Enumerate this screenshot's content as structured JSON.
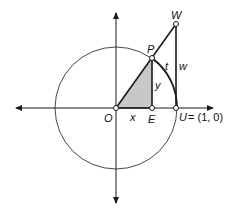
{
  "diagram": {
    "type": "unit-circle",
    "labels": {
      "origin": "O",
      "foot": "E",
      "unit_point": "U",
      "unit_point_coord": "= (1, 0)",
      "circle_point": "P",
      "tangent_point": "W",
      "x_segment": "x",
      "y_segment": "y",
      "arc": "t",
      "tangent_segment": "w"
    },
    "colors": {
      "stroke": "#1a1a1a",
      "circle": "#333333",
      "shade": "#c8c8c8"
    }
  }
}
